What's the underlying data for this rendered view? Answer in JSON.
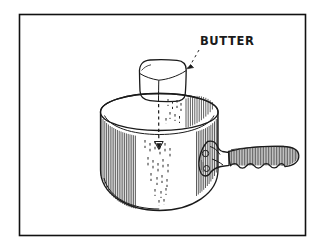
{
  "illustration": {
    "title": "butter-dropping-into-saucepan",
    "style": "hand-drawn-line-art",
    "background_color": "#ffffff",
    "ink_color": "#1a1a1a",
    "frame": {
      "name": "border-frame",
      "x": 19,
      "y": 14,
      "width": 286,
      "height": 221,
      "stroke_color": "#111111"
    },
    "annotations": [
      {
        "name": "butter-label",
        "text": "BUTTER",
        "x": 200,
        "y": 45,
        "leader": "dashed-line-with-arrowhead",
        "leader_from": [
          198,
          50
        ],
        "leader_to": [
          189,
          69
        ]
      }
    ],
    "objects": [
      {
        "name": "butter-cube",
        "label": "BUTTER",
        "shape": "rounded-cube",
        "faces": [
          "top",
          "left",
          "right"
        ],
        "bounds": [
          134,
          60,
          52,
          42
        ]
      },
      {
        "name": "saucepan-pot",
        "shape": "cylinder",
        "bounds": [
          100,
          93,
          118,
          117
        ],
        "features": [
          "elliptical-rim",
          "inner-rim-line",
          "vertical-hatching",
          "rounded-bottom"
        ]
      },
      {
        "name": "saucepan-handle",
        "shape": "scalloped-grip",
        "bounds": [
          227,
          145,
          72,
          28
        ],
        "features": [
          "four-finger-scallops",
          "dense-vertical-hatching",
          "rounded-end"
        ]
      },
      {
        "name": "handle-bracket",
        "shape": "triangular-metal-plate",
        "bounds": [
          198,
          141,
          32,
          34
        ],
        "features": [
          "two-rivets"
        ]
      },
      {
        "name": "falling-motion-line",
        "shape": "dashed-vertical-arrow",
        "from": [
          158,
          104
        ],
        "to": [
          159,
          148
        ],
        "arrowhead": "down-triangle"
      }
    ]
  }
}
